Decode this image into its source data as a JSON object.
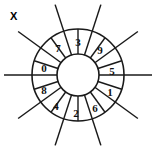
{
  "figure": {
    "label": "X",
    "title": "",
    "background_color": "#ffffff",
    "stroke_color": "#1a1a1a",
    "text_color": "#111111"
  },
  "diagram": {
    "type": "segmented-wheel",
    "center": {
      "x": 78,
      "y": 75
    },
    "inner_radius": 21,
    "outer_radius": 46,
    "spoke_overhang": 74,
    "sector_count": 10,
    "spoke_count": 5,
    "sectors": [
      {
        "id": "sector-3",
        "value": "3",
        "angle_deg": -72,
        "label_x": 78,
        "label_y": 42
      },
      {
        "id": "sector-9",
        "value": "9",
        "angle_deg": -36,
        "label_x": 100,
        "label_y": 50
      },
      {
        "id": "sector-5",
        "value": "5",
        "angle_deg": 0,
        "label_x": 112,
        "label_y": 71
      },
      {
        "id": "sector-1",
        "value": "1",
        "angle_deg": 36,
        "label_x": 110,
        "label_y": 92
      },
      {
        "id": "sector-6",
        "value": "6",
        "angle_deg": 72,
        "label_x": 95,
        "label_y": 108
      },
      {
        "id": "sector-2",
        "value": "2",
        "angle_deg": 108,
        "label_x": 76,
        "label_y": 113
      },
      {
        "id": "sector-4",
        "value": "4",
        "angle_deg": 144,
        "label_x": 56,
        "label_y": 106
      },
      {
        "id": "sector-8",
        "value": "8",
        "angle_deg": 180,
        "label_x": 44,
        "label_y": 90
      },
      {
        "id": "sector-0",
        "value": "0",
        "angle_deg": 216,
        "label_x": 44,
        "label_y": 68
      },
      {
        "id": "sector-7",
        "value": "7",
        "angle_deg": 252,
        "label_x": 58,
        "label_y": 48
      }
    ],
    "spokes": [
      {
        "id": "spoke-horizontal",
        "angle_deg": 0
      },
      {
        "id": "spoke-ne-sw",
        "angle_deg": -36
      },
      {
        "id": "spoke-near-vertical-right",
        "angle_deg": -72
      },
      {
        "id": "spoke-near-vertical-left",
        "angle_deg": -108
      },
      {
        "id": "spoke-nw-se",
        "angle_deg": -144
      }
    ],
    "sector_values_clockwise_from_top": [
      "3",
      "9",
      "5",
      "1",
      "6",
      "2",
      "4",
      "8",
      "0",
      "7"
    ]
  }
}
